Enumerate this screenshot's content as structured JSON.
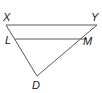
{
  "diagram": {
    "type": "geometry-triangle",
    "colors": {
      "stroke": "#5a5a5a",
      "label": "#1a1a1a",
      "background": "#ffffff"
    },
    "points": {
      "X": {
        "label": "X",
        "x": 6,
        "y": 25
      },
      "Y": {
        "label": "Y",
        "x": 97,
        "y": 25
      },
      "L": {
        "label": "L",
        "x": 15,
        "y": 39
      },
      "M": {
        "label": "M",
        "x": 87,
        "y": 39
      },
      "D": {
        "label": "D",
        "x": 37,
        "y": 76
      }
    },
    "segments": [
      "XY",
      "LM",
      "XD",
      "YD"
    ]
  }
}
